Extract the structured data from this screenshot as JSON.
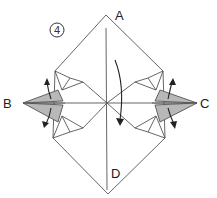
{
  "diagram": {
    "step_number": "4",
    "labels": {
      "top": "A",
      "left": "B",
      "right": "C",
      "bottom": "D"
    },
    "colors": {
      "line": "#555555",
      "shaded_flap": "#b8b8b8",
      "paper": "#ffffff",
      "arrow": "#222222"
    }
  }
}
